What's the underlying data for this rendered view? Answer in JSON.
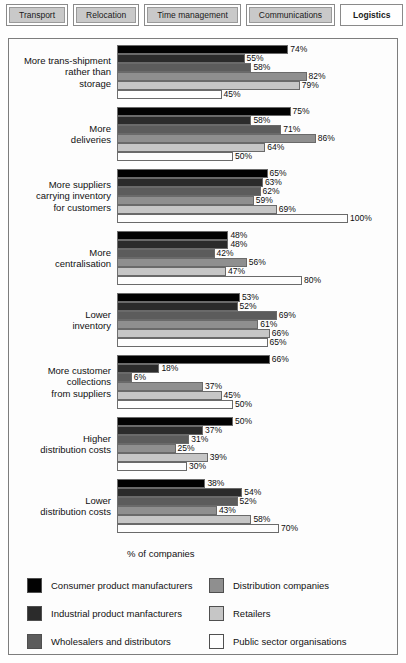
{
  "tabs": [
    {
      "label": "Transport",
      "active": false
    },
    {
      "label": "Relocation",
      "active": false
    },
    {
      "label": "Time management",
      "active": false
    },
    {
      "label": "Communications",
      "active": false
    },
    {
      "label": "Logistics",
      "active": true
    }
  ],
  "chart_data": {
    "type": "bar",
    "orientation": "horizontal",
    "title": "",
    "xlabel": "% of companies",
    "ylabel": "",
    "xlim": [
      0,
      100
    ],
    "grid": false,
    "legend_position": "bottom",
    "value_suffix": "%",
    "categories": [
      "More trans-shipment\nrather than\nstorage",
      "More\ndeliveries",
      "More suppliers\ncarrying inventory\nfor customers",
      "More\ncentralisation",
      "Lower\ninventory",
      "More customer\ncollections\nfrom suppliers",
      "Higher\ndistribution costs",
      "Lower\ndistribution costs"
    ],
    "series": [
      {
        "name": "Consumer product manufacturers",
        "color": "#020202",
        "values": [
          74,
          75,
          65,
          48,
          53,
          66,
          50,
          38
        ]
      },
      {
        "name": "Industrial product manfacturers",
        "color": "#2b2b2b",
        "values": [
          55,
          58,
          63,
          48,
          52,
          18,
          37,
          54
        ]
      },
      {
        "name": "Wholesalers and distributors",
        "color": "#5c5c5c",
        "values": [
          58,
          71,
          62,
          42,
          69,
          6,
          31,
          52
        ]
      },
      {
        "name": "Distribution companies",
        "color": "#8f8f8f",
        "values": [
          82,
          86,
          59,
          56,
          61,
          37,
          25,
          43
        ]
      },
      {
        "name": "Retailers",
        "color": "#c6c6c6",
        "values": [
          79,
          64,
          69,
          47,
          66,
          45,
          39,
          58
        ]
      },
      {
        "name": "Public sector organisations",
        "color": "#fdfdfd",
        "values": [
          45,
          50,
          100,
          80,
          65,
          50,
          30,
          70
        ]
      }
    ]
  },
  "legend": {
    "items": [
      {
        "label": "Consumer product manufacturers",
        "swatch": "#020202"
      },
      {
        "label": "Distribution companies",
        "swatch": "#8f8f8f"
      },
      {
        "label": "Industrial product manfacturers",
        "swatch": "#2b2b2b"
      },
      {
        "label": "Retailers",
        "swatch": "#c6c6c6"
      },
      {
        "label": "Wholesalers and distributors",
        "swatch": "#5c5c5c"
      },
      {
        "label": "Public sector organisations",
        "swatch": "#fdfdfd"
      }
    ]
  }
}
